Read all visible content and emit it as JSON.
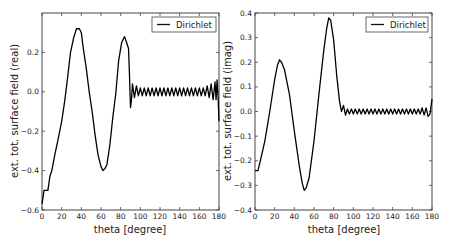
{
  "chart_data": [
    {
      "type": "line",
      "title": "",
      "xlabel": "theta [degree]",
      "ylabel": "ext. tot. surface field (real)",
      "xlim": [
        0,
        180
      ],
      "ylim": [
        -0.6,
        0.4
      ],
      "xticks": [
        "0",
        "20",
        "40",
        "60",
        "80",
        "100",
        "120",
        "140",
        "160",
        "180"
      ],
      "yticks": [
        "-0.6",
        "-0.4",
        "-0.2",
        "0.0",
        "0.2"
      ],
      "ytick_values": [
        -0.6,
        -0.4,
        -0.2,
        0.0,
        0.2
      ],
      "grid": false,
      "legend": {
        "position": "upper right",
        "entries": [
          "Dirichlet"
        ]
      },
      "series": [
        {
          "name": "Dirichlet",
          "color": "#000000",
          "x": [
            0,
            2,
            4,
            6,
            8,
            10,
            13,
            16,
            20,
            23,
            26,
            29,
            32,
            35,
            38,
            40,
            42,
            45,
            48,
            51,
            54,
            57,
            60,
            62,
            64,
            66,
            69,
            72,
            75,
            78,
            81,
            84,
            86,
            88,
            89,
            90,
            91,
            92,
            94,
            96,
            98,
            100,
            102,
            104,
            106,
            108,
            110,
            112,
            114,
            116,
            118,
            120,
            122,
            124,
            126,
            128,
            130,
            132,
            134,
            136,
            138,
            140,
            142,
            144,
            146,
            148,
            150,
            152,
            154,
            156,
            158,
            160,
            162,
            164,
            166,
            168,
            170,
            172,
            174,
            176,
            177,
            178,
            179,
            180
          ],
          "y": [
            -0.57,
            -0.5,
            -0.5,
            -0.5,
            -0.43,
            -0.4,
            -0.32,
            -0.25,
            -0.15,
            -0.05,
            0.07,
            0.2,
            0.27,
            0.32,
            0.32,
            0.3,
            0.22,
            0.12,
            0.0,
            -0.1,
            -0.22,
            -0.32,
            -0.38,
            -0.4,
            -0.39,
            -0.37,
            -0.27,
            -0.13,
            -0.01,
            0.16,
            0.25,
            0.28,
            0.25,
            0.22,
            0.08,
            -0.08,
            -0.04,
            0.04,
            -0.03,
            0.03,
            -0.02,
            0.02,
            -0.02,
            0.02,
            -0.02,
            0.02,
            -0.02,
            0.02,
            -0.02,
            0.02,
            -0.02,
            0.02,
            -0.02,
            0.02,
            -0.02,
            0.02,
            -0.02,
            0.02,
            -0.02,
            0.02,
            -0.02,
            0.02,
            -0.02,
            0.02,
            -0.02,
            0.02,
            -0.02,
            0.02,
            -0.02,
            0.02,
            -0.02,
            0.02,
            -0.02,
            0.02,
            -0.02,
            0.03,
            -0.03,
            0.04,
            -0.04,
            0.05,
            -0.04,
            0.06,
            -0.02,
            -0.15
          ]
        }
      ]
    },
    {
      "type": "line",
      "title": "",
      "xlabel": "theta [degree]",
      "ylabel": "ext. tot. surface field (imag)",
      "xlim": [
        0,
        180
      ],
      "ylim": [
        -0.4,
        0.4
      ],
      "xticks": [
        "0",
        "20",
        "40",
        "60",
        "80",
        "100",
        "120",
        "140",
        "160",
        "180"
      ],
      "yticks": [
        "-0.4",
        "-0.3",
        "-0.2",
        "-0.1",
        "0.0",
        "0.1",
        "0.2",
        "0.3",
        "0.4"
      ],
      "ytick_values": [
        -0.4,
        -0.3,
        -0.2,
        -0.1,
        0.0,
        0.1,
        0.2,
        0.3,
        0.4
      ],
      "grid": false,
      "legend": {
        "position": "upper right",
        "entries": [
          "Dirichlet"
        ]
      },
      "series": [
        {
          "name": "Dirichlet",
          "color": "#000000",
          "x": [
            0,
            3,
            6,
            10,
            15,
            20,
            23,
            25,
            27,
            30,
            35,
            40,
            45,
            48,
            50,
            52,
            55,
            60,
            65,
            70,
            73,
            75,
            77,
            80,
            83,
            86,
            88,
            90,
            92,
            94,
            96,
            98,
            100,
            102,
            104,
            106,
            108,
            110,
            112,
            114,
            116,
            118,
            120,
            122,
            124,
            126,
            128,
            130,
            132,
            134,
            136,
            138,
            140,
            142,
            144,
            146,
            148,
            150,
            152,
            154,
            156,
            158,
            160,
            162,
            164,
            166,
            168,
            170,
            172,
            174,
            176,
            178,
            180
          ],
          "y": [
            -0.24,
            -0.24,
            -0.19,
            -0.12,
            0.0,
            0.13,
            0.19,
            0.21,
            0.2,
            0.17,
            0.07,
            -0.08,
            -0.22,
            -0.29,
            -0.32,
            -0.31,
            -0.27,
            -0.12,
            0.07,
            0.25,
            0.34,
            0.38,
            0.37,
            0.29,
            0.15,
            0.04,
            0.0,
            0.025,
            -0.015,
            0.01,
            -0.01,
            0.01,
            -0.01,
            0.01,
            -0.01,
            0.01,
            -0.01,
            0.01,
            -0.01,
            0.01,
            -0.01,
            0.01,
            -0.01,
            0.01,
            -0.01,
            0.01,
            -0.01,
            0.01,
            -0.01,
            0.01,
            -0.01,
            0.01,
            -0.01,
            0.01,
            -0.01,
            0.01,
            -0.01,
            0.01,
            -0.01,
            0.01,
            -0.01,
            0.01,
            -0.01,
            0.01,
            -0.01,
            0.01,
            -0.01,
            0.015,
            -0.015,
            0.015,
            -0.02,
            -0.01,
            0.05
          ]
        }
      ]
    }
  ],
  "panels": [
    {
      "legend_label": "Dirichlet",
      "xlabel": "theta [degree]",
      "ylabel": "ext. tot. surface field (real)"
    },
    {
      "legend_label": "Dirichlet",
      "xlabel": "theta [degree]",
      "ylabel": "ext. tot. surface field (imag)"
    }
  ]
}
